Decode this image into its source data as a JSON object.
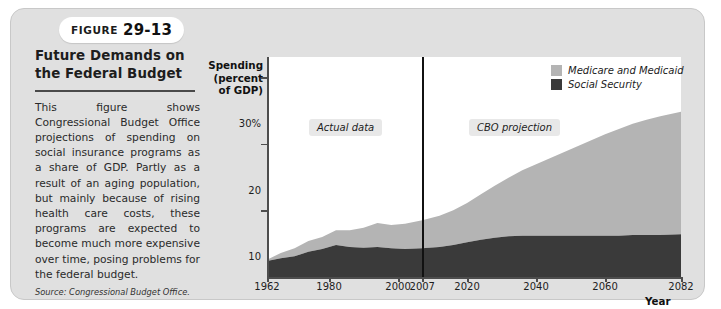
{
  "figure": {
    "badge_word": "Figure",
    "badge_number": "29-13",
    "title": "Future Demands on the Federal Budget",
    "body": "This figure shows Congressional Budget Office projections of spending on social insurance programs as a share of GDP. Partly as a result of an aging population, but mainly because of rising health care costs, these programs are expected to become much more expensive over time, posing problems for the federal budget.",
    "source": "Source: Congressional Budget Office."
  },
  "legend": {
    "items": [
      {
        "label": "Medicare and Medicaid",
        "color": "#b4b4b4"
      },
      {
        "label": "Social Security",
        "color": "#3a3a3a"
      }
    ]
  },
  "annotations": [
    {
      "name": "actual-data",
      "text": "Actual data"
    },
    {
      "name": "cbo-projection",
      "text": "CBO projection"
    }
  ],
  "colors": {
    "card_bg": "#e0e0e0",
    "plot_bg": "#ffffff",
    "axis": "#4d4d4d",
    "medicare": "#b4b4b4",
    "social_security": "#3a3a3a",
    "divider": "#111111"
  },
  "chart_data": {
    "type": "area",
    "stacked": true,
    "title": "Future Demands on the Federal Budget",
    "xlabel": "Year",
    "ylabel": "Spending (percent of GDP)",
    "xlim": [
      1962,
      2082
    ],
    "ylim": [
      0,
      33
    ],
    "yticks": [
      10,
      20,
      30
    ],
    "ytick_labels": [
      "10",
      "20",
      "30%"
    ],
    "xticks": [
      1962,
      1980,
      2000,
      2007,
      2020,
      2040,
      2060,
      2082
    ],
    "xtick_labels": [
      "1962",
      "1980",
      "2000",
      "2007",
      "2020",
      "2040",
      "2060",
      "2082"
    ],
    "grid": false,
    "legend_position": "top-right",
    "divider_year": 2007,
    "divider_label_left": "Actual data",
    "divider_label_right": "CBO projection",
    "x": [
      1962,
      1966,
      1970,
      1974,
      1978,
      1982,
      1986,
      1990,
      1994,
      1998,
      2002,
      2007,
      2012,
      2016,
      2020,
      2024,
      2028,
      2032,
      2036,
      2040,
      2044,
      2048,
      2052,
      2056,
      2060,
      2064,
      2068,
      2072,
      2076,
      2082
    ],
    "series": [
      {
        "name": "Social Security",
        "color": "#3a3a3a",
        "values": [
          2.4,
          2.8,
          3.1,
          3.8,
          4.2,
          4.8,
          4.5,
          4.4,
          4.5,
          4.3,
          4.2,
          4.3,
          4.5,
          4.8,
          5.2,
          5.6,
          5.9,
          6.1,
          6.2,
          6.2,
          6.2,
          6.2,
          6.2,
          6.2,
          6.2,
          6.2,
          6.3,
          6.3,
          6.3,
          6.4
        ]
      },
      {
        "name": "Medicare and Medicaid",
        "color": "#b4b4b4",
        "values": [
          0.2,
          0.8,
          1.2,
          1.6,
          1.8,
          2.2,
          2.5,
          3.0,
          3.6,
          3.5,
          3.8,
          4.2,
          4.7,
          5.2,
          5.9,
          6.8,
          7.8,
          8.8,
          9.8,
          10.7,
          11.6,
          12.5,
          13.4,
          14.3,
          15.2,
          16.0,
          16.7,
          17.3,
          17.8,
          18.4
        ]
      }
    ]
  }
}
